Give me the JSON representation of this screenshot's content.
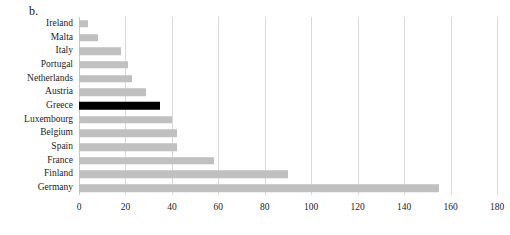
{
  "panel": {
    "label": "b."
  },
  "chart_data": {
    "type": "bar",
    "orientation": "horizontal",
    "title": "",
    "subtitle": "",
    "xlabel": "",
    "ylabel": "",
    "xlim": [
      0,
      180
    ],
    "xticks": [
      0,
      20,
      40,
      60,
      80,
      100,
      120,
      140,
      160,
      180
    ],
    "grid": true,
    "legend": "none",
    "categories": [
      "Ireland",
      "Malta",
      "Italy",
      "Portugal",
      "Netherlands",
      "Austria",
      "Greece",
      "Luxembourg",
      "Belgium",
      "Spain",
      "France",
      "Finland",
      "Germany"
    ],
    "values": [
      4,
      8,
      18,
      21,
      23,
      29,
      35,
      40,
      42,
      42,
      58,
      90,
      155
    ],
    "highlight_category": "Greece",
    "colors": {
      "bar": "#c0c0c0",
      "highlight": "#000000",
      "gridline": "#d9d9d9",
      "text": "#1d1d1d"
    }
  }
}
